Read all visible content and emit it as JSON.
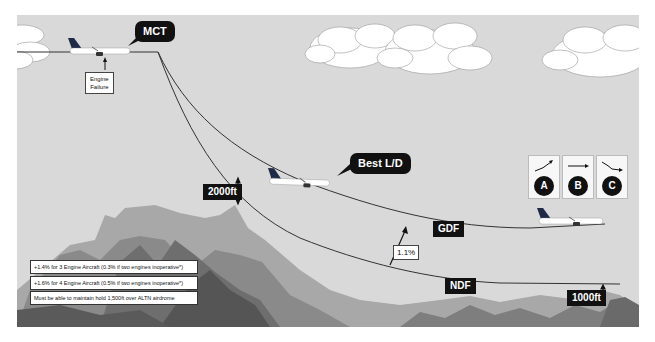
{
  "diagram": {
    "title_context": "Engine failure drift-down profiles",
    "colors": {
      "sky": "#d9d9d9",
      "cloud": "#ffffff",
      "path_line": "#333333",
      "label_bg": "#111111",
      "label_text": "#ffffff",
      "terrain_dark": "#5a5a5a",
      "terrain_mid": "#7e7e7e",
      "terrain_light": "#a8a8a8"
    },
    "callouts": {
      "mct": "MCT",
      "best_ld": "Best L/D"
    },
    "labels": {
      "engine_failure_line1": "Engine",
      "engine_failure_line2": "Failure",
      "clearance_2000": "2000ft",
      "clearance_1000": "1000ft",
      "gdf": "GDF",
      "ndf": "NDF",
      "gradient_margin": "1.1%"
    },
    "notes": [
      "+1.4% for 3 Engine Aircraft (0.3% if two engines inoperative*)",
      "+1.6% for 4 Engine Aircraft (0.5% if two engines inoperative*)",
      "Must be able to maintain hold 1,500ft over ALTN airdrome"
    ],
    "legend": [
      {
        "letter": "A",
        "icon": "climb-arrow-icon"
      },
      {
        "letter": "B",
        "icon": "level-arrow-icon"
      },
      {
        "letter": "C",
        "icon": "descent-arrow-icon"
      }
    ]
  }
}
